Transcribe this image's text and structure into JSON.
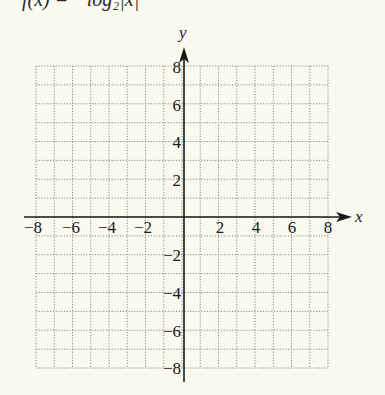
{
  "title_clipped": "f(x) = −log₂|x|",
  "graph": {
    "x_axis_label": "x",
    "y_axis_label": "y",
    "x_range": [
      -8,
      8
    ],
    "y_range": [
      -8,
      8
    ],
    "grid_step": 1,
    "grid_style": "dotted",
    "x_tick_labels": [
      "−8",
      "−6",
      "−4",
      "−2",
      "2",
      "4",
      "6",
      "8"
    ],
    "y_tick_labels": [
      "8",
      "6",
      "4",
      "2",
      "−2",
      "−4",
      "−6",
      "−8"
    ],
    "colors": {
      "background": "#fbfaf1",
      "axis": "#1a1a1a",
      "grid": "#8a8a8a"
    }
  }
}
